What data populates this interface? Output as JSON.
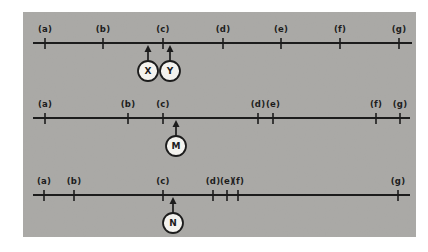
{
  "figure": {
    "colors": {
      "page_bg": "#ffffff",
      "panel_bg": "#a9a8a5",
      "ink": "#1c1c1c",
      "circle_fill": "#f4f3ef"
    },
    "panel": {
      "x": 23,
      "y": 12,
      "width": 393,
      "height": 225
    },
    "number_lines": [
      {
        "id": "top",
        "axis_y": 43,
        "x_start": 33,
        "x_end": 412,
        "ticks": [
          {
            "label": "(a)",
            "x": 45
          },
          {
            "label": "(b)",
            "x": 103
          },
          {
            "label": "(c)",
            "x": 163
          },
          {
            "label": "(d)",
            "x": 223
          },
          {
            "label": "(e)",
            "x": 281
          },
          {
            "label": "(f)",
            "x": 340
          },
          {
            "label": "(g)",
            "x": 399
          }
        ],
        "pointers": [
          {
            "label": "X",
            "x": 148
          },
          {
            "label": "Y",
            "x": 170
          }
        ]
      },
      {
        "id": "middle",
        "axis_y": 118,
        "x_start": 33,
        "x_end": 410,
        "ticks": [
          {
            "label": "(a)",
            "x": 45
          },
          {
            "label": "(b)",
            "x": 128
          },
          {
            "label": "(c)",
            "x": 163
          },
          {
            "label": "(d)",
            "x": 258
          },
          {
            "label": "(e)",
            "x": 273
          },
          {
            "label": "(f)",
            "x": 376
          },
          {
            "label": "(g)",
            "x": 400
          }
        ],
        "pointers": [
          {
            "label": "M",
            "x": 176
          }
        ]
      },
      {
        "id": "bottom",
        "axis_y": 195,
        "x_start": 33,
        "x_end": 410,
        "ticks": [
          {
            "label": "(a)",
            "x": 44
          },
          {
            "label": "(b)",
            "x": 74
          },
          {
            "label": "(c)",
            "x": 163
          },
          {
            "label": "(d)",
            "x": 213
          },
          {
            "label": "(e)",
            "x": 227
          },
          {
            "label": "(f)",
            "x": 238
          },
          {
            "label": "(g)",
            "x": 398
          }
        ],
        "pointers": [
          {
            "label": "N",
            "x": 173
          }
        ]
      }
    ]
  }
}
